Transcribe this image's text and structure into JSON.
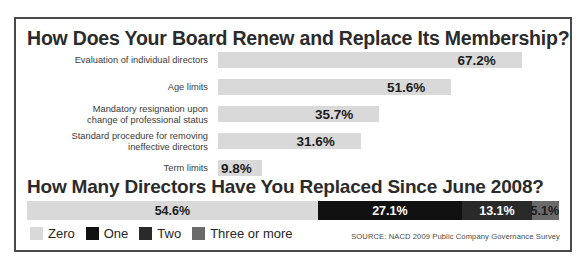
{
  "colors": {
    "frame": "#4a4a4a",
    "bar_fill": "#d9d9d9",
    "zero": "#d9d9d9",
    "one": "#111111",
    "two": "#2a2a2a",
    "three_or_more": "#6a6a6a",
    "text_dark": "#1c1c1c",
    "text_light": "#ffffff"
  },
  "section1": {
    "title": "How Does Your Board Renew and Replace Its Membership?"
  },
  "section2": {
    "title": "How Many Directors Have You Replaced Since June 2008?"
  },
  "legend": {
    "items": [
      {
        "label": "Zero",
        "color": "#d9d9d9"
      },
      {
        "label": "One",
        "color": "#111111"
      },
      {
        "label": "Two",
        "color": "#2a2a2a"
      },
      {
        "label": "Three or more",
        "color": "#6a6a6a"
      }
    ]
  },
  "source": "SOURCE:  NACD 2009 Public Company Governance Survey",
  "chart_data": [
    {
      "type": "bar",
      "title": "How Does Your Board Renew and Replace Its Membership?",
      "orientation": "horizontal",
      "xlabel": "",
      "ylabel": "",
      "xlim": [
        0,
        70
      ],
      "grid": false,
      "legend": "none",
      "categories": [
        "Evaluation of individual directors",
        "Age limits",
        "Mandatory resignation upon\nchange of professional status",
        "Standard procedure for removing\nineffective directors",
        "Term limits"
      ],
      "values": [
        67.2,
        51.6,
        35.7,
        31.6,
        9.8
      ],
      "value_labels": [
        "67.2%",
        "51.6%",
        "35.7%",
        "31.6%",
        "9.8%"
      ]
    },
    {
      "type": "bar",
      "title": "How Many Directors Have You Replaced Since June 2008?",
      "orientation": "horizontal",
      "stacked": true,
      "xlabel": "",
      "ylabel": "",
      "grid": false,
      "legend": "bottom-left",
      "categories": [
        "Zero",
        "One",
        "Two",
        "Three or more"
      ],
      "values": [
        54.6,
        27.1,
        13.1,
        5.1
      ],
      "value_labels": [
        "54.6%",
        "27.1%",
        "13.1%",
        "5.1%"
      ]
    }
  ]
}
